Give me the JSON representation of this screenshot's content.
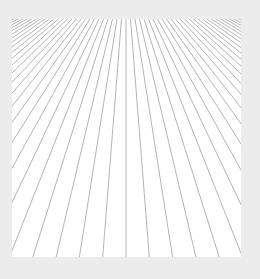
{
  "canvas": {
    "width": 260,
    "height": 279,
    "background_color": "#ececec"
  },
  "panel": {
    "x": 12,
    "y": 19,
    "width": 229,
    "height": 238,
    "fill_color": "#ffffff"
  },
  "pattern": {
    "type": "radiating-lines",
    "line_color": "#b4b4b4",
    "line_width": 1,
    "vanishing_point": {
      "x": 114,
      "y": -57
    },
    "bottom_spacing": 23.3,
    "bottom_center_x": 114,
    "line_count_each_side": 40
  }
}
